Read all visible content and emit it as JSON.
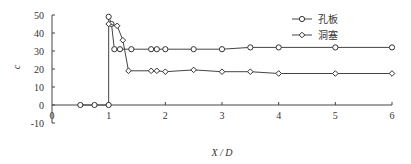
{
  "chart_data": {
    "type": "line",
    "title": "",
    "xlabel": "X / D",
    "ylabel": "c",
    "xlim": [
      0,
      6
    ],
    "ylim": [
      -10,
      50
    ],
    "xticks": [
      "0",
      "1",
      "2",
      "3",
      "4",
      "5",
      "6"
    ],
    "yticks": [
      "-10",
      "0",
      "10",
      "20",
      "30",
      "40",
      "50"
    ],
    "grid": false,
    "legend_position": "upper right",
    "series": [
      {
        "name": "孔板",
        "marker": "circle",
        "x": [
          0.5,
          0.75,
          1.0,
          1.0,
          1.05,
          1.1,
          1.2,
          1.4,
          1.75,
          1.85,
          2.0,
          2.5,
          3.0,
          3.5,
          4.0,
          5.0,
          6.0
        ],
        "values": [
          0,
          0,
          0,
          49,
          45,
          31,
          31,
          31,
          31,
          31,
          31,
          31,
          31,
          32,
          32,
          32,
          32
        ]
      },
      {
        "name": "洞塞",
        "marker": "diamond",
        "x": [
          1.0,
          1.15,
          1.25,
          1.35,
          1.75,
          1.85,
          2.0,
          2.5,
          3.0,
          3.5,
          4.0,
          5.0,
          6.0
        ],
        "values": [
          45,
          44,
          36,
          19,
          19,
          19,
          18.5,
          19.5,
          18.5,
          18.5,
          17.5,
          17.5,
          17.5
        ]
      }
    ]
  }
}
